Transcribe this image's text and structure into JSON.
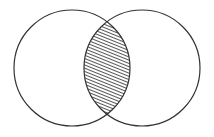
{
  "diagram": {
    "type": "venn",
    "sets": [
      {
        "name": "left-set",
        "cx": 72,
        "cy": 68,
        "r": 58
      },
      {
        "name": "right-set",
        "cx": 142,
        "cy": 68,
        "r": 58
      }
    ],
    "highlighted_region": "intersection",
    "highlight_style": "diagonal-hatch",
    "colors": {
      "stroke": "#333333",
      "hatch": "#444444",
      "background": "#ffffff"
    }
  }
}
